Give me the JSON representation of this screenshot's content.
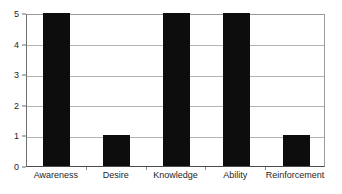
{
  "chart_data": {
    "type": "bar",
    "title": "",
    "subtitle": "",
    "xlabel": "",
    "ylabel": "",
    "categories": [
      "Awareness",
      "Desire",
      "Knowledge",
      "Ability",
      "Reinforcement"
    ],
    "values": [
      5,
      1,
      5,
      5,
      1
    ],
    "ylim": [
      0,
      5
    ],
    "ytick_labels": [
      "0",
      "1",
      "2",
      "3",
      "4",
      "5"
    ],
    "ytick_values": [
      0,
      1,
      2,
      3,
      4,
      5
    ],
    "grid": true,
    "grid_axis": "y",
    "legend": false,
    "legend_position": "none",
    "annotations": [],
    "colors": {
      "bar": "#0d0d0d",
      "gridline": "#b4b4b4",
      "axis": "#6e6e6e",
      "background": "#ffffff",
      "tick_label": "#1f1f1f"
    }
  }
}
